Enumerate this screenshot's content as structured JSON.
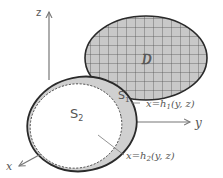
{
  "diagram": {
    "type": "3d-region-projection",
    "axes": {
      "z": {
        "label": "z"
      },
      "y": {
        "label": "y"
      },
      "x": {
        "label": "x"
      }
    },
    "regions": {
      "projection": {
        "label": "D",
        "pattern": "grid"
      },
      "surface_back": {
        "label": "S",
        "subscript": "1"
      },
      "surface_front": {
        "label": "S",
        "subscript": "2"
      }
    },
    "annotations": {
      "h1": {
        "lhs": "x",
        "eq": "=",
        "fn": "h",
        "sub": "1",
        "args": "(y, z)"
      },
      "h2": {
        "lhs": "x",
        "eq": "=",
        "fn": "h",
        "sub": "2",
        "args": "(y, z)"
      }
    },
    "colors": {
      "grid_fill": "#c8c8c8",
      "grid_line": "#555555",
      "s1_fill": "#d0d0d0",
      "outline": "#2a2a2a",
      "axis": "#777777",
      "text": "#555555"
    }
  }
}
